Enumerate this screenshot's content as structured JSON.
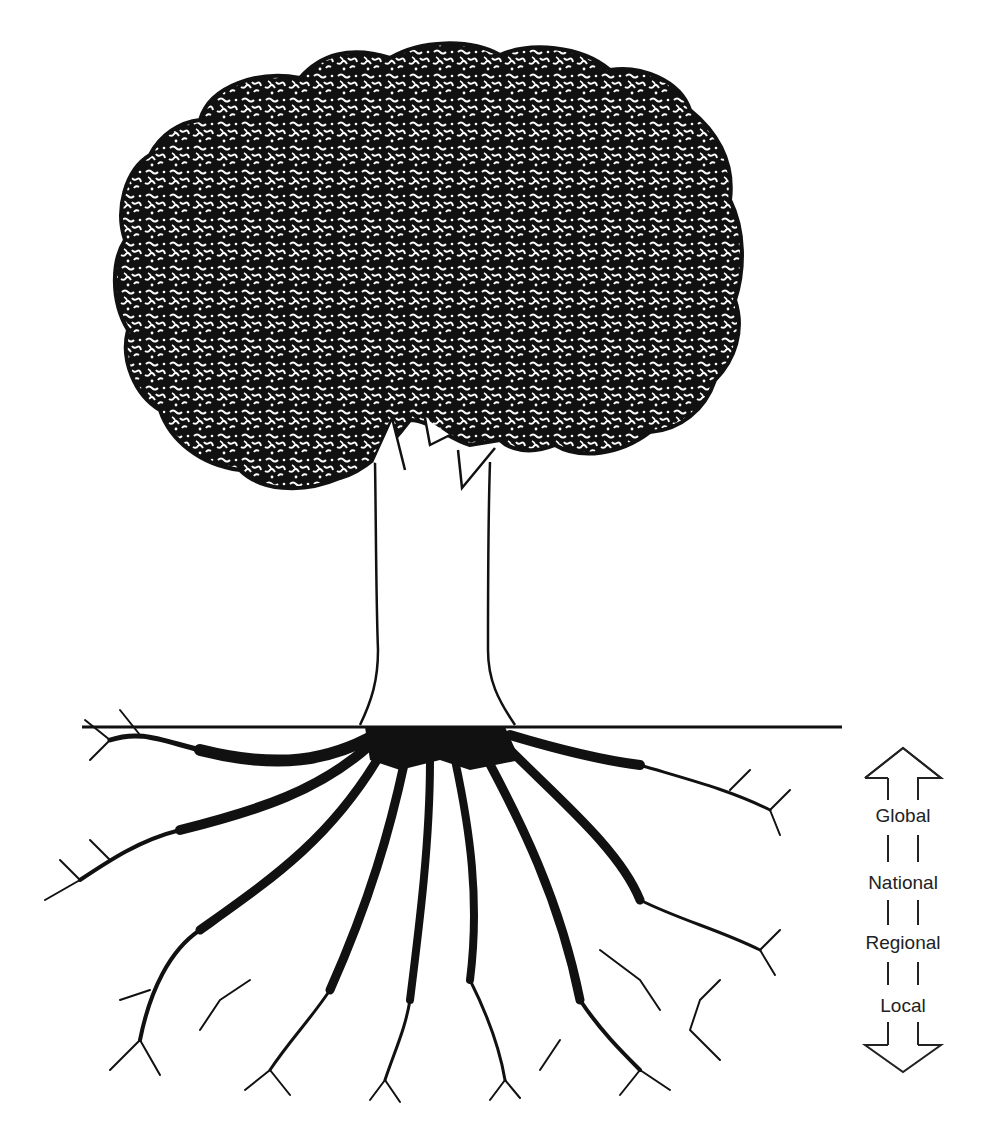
{
  "figure": {
    "colors": {
      "ink": "#111111",
      "background": "#ffffff",
      "label": "#222222"
    }
  },
  "scale": {
    "arrow": "double-headed-vertical-arrow",
    "labels": [
      "Global",
      "National",
      "Regional",
      "Local"
    ]
  },
  "tree": {
    "parts": [
      "crown",
      "trunk",
      "ground-line",
      "roots"
    ]
  }
}
